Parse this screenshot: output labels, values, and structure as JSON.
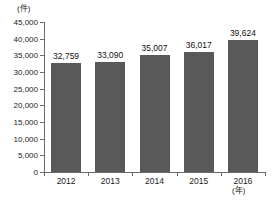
{
  "chart_data": {
    "type": "bar",
    "title": "",
    "subtitle": "",
    "xlabel": "(年)",
    "ylabel": "(件)",
    "categories": [
      "2012",
      "2013",
      "2014",
      "2015",
      "2016"
    ],
    "values": [
      32759,
      33090,
      35007,
      36017,
      39624
    ],
    "value_labels": [
      "32,759",
      "33,090",
      "35,007",
      "36,017",
      "39,624"
    ],
    "ylim": [
      0,
      45000
    ],
    "ytick_values": [
      0,
      5000,
      10000,
      15000,
      20000,
      25000,
      30000,
      35000,
      40000,
      45000
    ],
    "ytick_labels": [
      "0",
      "5,000",
      "10,000",
      "15,000",
      "20,000",
      "25,000",
      "30,000",
      "35,000",
      "40,000",
      "45,000"
    ],
    "grid": false,
    "legend": null,
    "series": [
      {
        "name": "件数",
        "values": [
          32759,
          33090,
          35007,
          36017,
          39624
        ]
      }
    ],
    "colors": {
      "bar": "#595959",
      "axis": "#6b6b6b",
      "text": "#1a1a1a",
      "background": "#ffffff"
    }
  }
}
